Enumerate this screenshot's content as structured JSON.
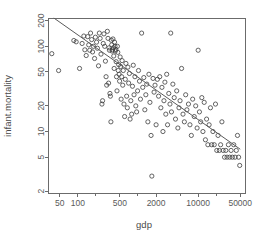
{
  "chart_data": {
    "type": "scatter",
    "title": "",
    "subtitle": "",
    "xlabel": "gdp",
    "ylabel": "infant.mortality",
    "xscale": "log",
    "yscale": "log",
    "xlim": [
      32,
      60000
    ],
    "ylim": [
      1.9,
      215
    ],
    "grid": false,
    "legend": null,
    "point_style": {
      "marker": "open-circle",
      "radius_px": 2.1,
      "stroke": "#3d3d3d"
    },
    "annotations": [],
    "trend_line": {
      "name": "linear fit (log-log)",
      "color": "#5a5a5a",
      "x_endpoints": [
        40,
        50000
      ],
      "y_endpoints": [
        215,
        6.2
      ]
    },
    "xticks": [
      {
        "value": 50,
        "label": "50"
      },
      {
        "value": 100,
        "label": "100"
      },
      {
        "value": 500,
        "label": "500"
      },
      {
        "value": 2000,
        "label": "2000"
      },
      {
        "value": 10000,
        "label": "10000"
      },
      {
        "value": 50000,
        "label": "50000"
      }
    ],
    "xticks_minor": [
      200,
      1000,
      5000,
      20000
    ],
    "yticks": [
      {
        "value": 200,
        "label": "200"
      },
      {
        "value": 100,
        "label": "100"
      },
      {
        "value": 50,
        "label": "50"
      },
      {
        "value": 20,
        "label": "20"
      },
      {
        "value": 10,
        "label": "10"
      },
      {
        "value": 5,
        "label": "5"
      },
      {
        "value": 2,
        "label": "2"
      }
    ],
    "points": [
      [
        37,
        82
      ],
      [
        48,
        52
      ],
      [
        86,
        117
      ],
      [
        94,
        113
      ],
      [
        107,
        55
      ],
      [
        118,
        108
      ],
      [
        126,
        132
      ],
      [
        131,
        91
      ],
      [
        138,
        78
      ],
      [
        146,
        130
      ],
      [
        152,
        104
      ],
      [
        158,
        90
      ],
      [
        163,
        143
      ],
      [
        170,
        120
      ],
      [
        176,
        86
      ],
      [
        182,
        100
      ],
      [
        190,
        72
      ],
      [
        196,
        128
      ],
      [
        205,
        112
      ],
      [
        212,
        95
      ],
      [
        221,
        59
      ],
      [
        228,
        143
      ],
      [
        235,
        124
      ],
      [
        243,
        81
      ],
      [
        252,
        21
      ],
      [
        258,
        23
      ],
      [
        265,
        108
      ],
      [
        272,
        140
      ],
      [
        280,
        100
      ],
      [
        288,
        67
      ],
      [
        295,
        44
      ],
      [
        302,
        35
      ],
      [
        310,
        150
      ],
      [
        318,
        124
      ],
      [
        325,
        37
      ],
      [
        330,
        96
      ],
      [
        336,
        90
      ],
      [
        342,
        28
      ],
      [
        348,
        26
      ],
      [
        355,
        13
      ],
      [
        360,
        118
      ],
      [
        366,
        104
      ],
      [
        372,
        88
      ],
      [
        378,
        91
      ],
      [
        384,
        122
      ],
      [
        390,
        96
      ],
      [
        396,
        77
      ],
      [
        402,
        55
      ],
      [
        408,
        112
      ],
      [
        415,
        100
      ],
      [
        421,
        88
      ],
      [
        428,
        92
      ],
      [
        434,
        66
      ],
      [
        440,
        44
      ],
      [
        448,
        30
      ],
      [
        455,
        100
      ],
      [
        462,
        85
      ],
      [
        470,
        52
      ],
      [
        478,
        61
      ],
      [
        486,
        47
      ],
      [
        495,
        39
      ],
      [
        505,
        75
      ],
      [
        515,
        58
      ],
      [
        525,
        24
      ],
      [
        535,
        44
      ],
      [
        545,
        68
      ],
      [
        558,
        35
      ],
      [
        570,
        52
      ],
      [
        585,
        21
      ],
      [
        600,
        15
      ],
      [
        615,
        41
      ],
      [
        630,
        63
      ],
      [
        648,
        26
      ],
      [
        665,
        19
      ],
      [
        680,
        57
      ],
      [
        700,
        37
      ],
      [
        720,
        48
      ],
      [
        740,
        14
      ],
      [
        760,
        23
      ],
      [
        785,
        16
      ],
      [
        810,
        34
      ],
      [
        835,
        60
      ],
      [
        860,
        27
      ],
      [
        890,
        44
      ],
      [
        920,
        20
      ],
      [
        950,
        17
      ],
      [
        985,
        30
      ],
      [
        1020,
        52
      ],
      [
        1060,
        39
      ],
      [
        1100,
        24
      ],
      [
        1150,
        143
      ],
      [
        1200,
        33
      ],
      [
        1250,
        43
      ],
      [
        1300,
        18
      ],
      [
        1350,
        27
      ],
      [
        1400,
        36
      ],
      [
        1460,
        13
      ],
      [
        1520,
        47
      ],
      [
        1580,
        22
      ],
      [
        1650,
        9
      ],
      [
        1700,
        3
      ],
      [
        1780,
        42
      ],
      [
        1850,
        29
      ],
      [
        1920,
        35
      ],
      [
        2000,
        12
      ],
      [
        2100,
        41
      ],
      [
        2200,
        26
      ],
      [
        2300,
        44
      ],
      [
        2400,
        19
      ],
      [
        2500,
        33
      ],
      [
        2600,
        10
      ],
      [
        2700,
        23
      ],
      [
        2800,
        38
      ],
      [
        2900,
        16
      ],
      [
        3000,
        47
      ],
      [
        3100,
        12
      ],
      [
        3250,
        28
      ],
      [
        3400,
        21
      ],
      [
        3500,
        143
      ],
      [
        3600,
        17
      ],
      [
        3800,
        36
      ],
      [
        4000,
        25
      ],
      [
        4200,
        14
      ],
      [
        4400,
        30
      ],
      [
        4600,
        11
      ],
      [
        4800,
        19
      ],
      [
        5000,
        23
      ],
      [
        5300,
        55
      ],
      [
        5600,
        16
      ],
      [
        5900,
        13
      ],
      [
        6200,
        27
      ],
      [
        6500,
        18
      ],
      [
        6900,
        21
      ],
      [
        7300,
        12
      ],
      [
        7700,
        9
      ],
      [
        8100,
        24
      ],
      [
        8600,
        15
      ],
      [
        9100,
        20
      ],
      [
        9600,
        11
      ],
      [
        10000,
        90
      ],
      [
        10500,
        17
      ],
      [
        11000,
        13
      ],
      [
        11500,
        25
      ],
      [
        12000,
        10
      ],
      [
        12600,
        22
      ],
      [
        13200,
        8
      ],
      [
        13800,
        14
      ],
      [
        14500,
        7
      ],
      [
        15200,
        12
      ],
      [
        16000,
        19
      ],
      [
        16800,
        7
      ],
      [
        17600,
        10
      ],
      [
        18500,
        7
      ],
      [
        19400,
        21
      ],
      [
        20400,
        6
      ],
      [
        21400,
        9
      ],
      [
        22500,
        6
      ],
      [
        23600,
        7
      ],
      [
        24800,
        13
      ],
      [
        26000,
        6
      ],
      [
        27400,
        5
      ],
      [
        28800,
        6
      ],
      [
        30200,
        5
      ],
      [
        31800,
        7
      ],
      [
        33400,
        5
      ],
      [
        35200,
        6
      ],
      [
        37000,
        5
      ],
      [
        39000,
        7
      ],
      [
        41000,
        5
      ],
      [
        43000,
        6
      ],
      [
        45000,
        9
      ],
      [
        47000,
        5
      ],
      [
        49000,
        4
      ]
    ]
  }
}
